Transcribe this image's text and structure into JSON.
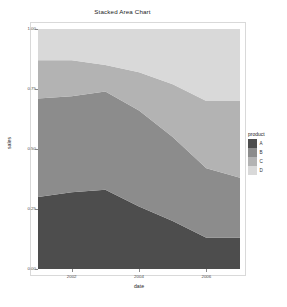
{
  "chart_data": {
    "type": "area",
    "title": "Stacked Area Chart",
    "xlabel": "date",
    "ylabel": "sales",
    "stacked": true,
    "normalized": true,
    "grid": false,
    "legend_position": "right",
    "legend_title": "product",
    "xlim": [
      2001,
      2007
    ],
    "ylim": [
      0.0,
      1.0
    ],
    "xticks": [
      2002,
      2004,
      2006
    ],
    "xtick_labels": [
      "2002",
      "2004",
      "2006"
    ],
    "yticks": [
      0.0,
      0.25,
      0.5,
      0.75,
      1.0
    ],
    "ytick_labels": [
      "0.00",
      "0.25",
      "0.50",
      "0.75",
      "1.00"
    ],
    "x": [
      2001,
      2002,
      2003,
      2004,
      2005,
      2006,
      2007
    ],
    "series": [
      {
        "name": "A",
        "color": "#4d4d4d",
        "values": [
          0.3,
          0.32,
          0.33,
          0.26,
          0.2,
          0.13,
          0.13
        ]
      },
      {
        "name": "B",
        "color": "#8c8c8c",
        "values": [
          0.41,
          0.4,
          0.41,
          0.4,
          0.35,
          0.29,
          0.25
        ]
      },
      {
        "name": "C",
        "color": "#b3b3b3",
        "values": [
          0.16,
          0.15,
          0.11,
          0.16,
          0.22,
          0.28,
          0.32
        ]
      },
      {
        "name": "D",
        "color": "#d9d9d9",
        "values": [
          0.13,
          0.13,
          0.15,
          0.18,
          0.23,
          0.3,
          0.3
        ]
      }
    ],
    "cumulative_upper_bounds": {
      "A": [
        0.3,
        0.32,
        0.33,
        0.26,
        0.2,
        0.13,
        0.13
      ],
      "B": [
        0.71,
        0.72,
        0.74,
        0.66,
        0.55,
        0.42,
        0.38
      ],
      "C": [
        0.87,
        0.87,
        0.85,
        0.82,
        0.77,
        0.7,
        0.7
      ],
      "D": [
        1.0,
        1.0,
        1.0,
        1.0,
        1.0,
        1.0,
        1.0
      ]
    }
  },
  "legend": {
    "title": "product",
    "items": [
      {
        "label": "A",
        "color": "#4d4d4d"
      },
      {
        "label": "B",
        "color": "#8c8c8c"
      },
      {
        "label": "C",
        "color": "#b3b3b3"
      },
      {
        "label": "D",
        "color": "#d9d9d9"
      }
    ]
  },
  "panel": {
    "background": "#f2f2f2",
    "border_color": "#d9d9d9"
  }
}
